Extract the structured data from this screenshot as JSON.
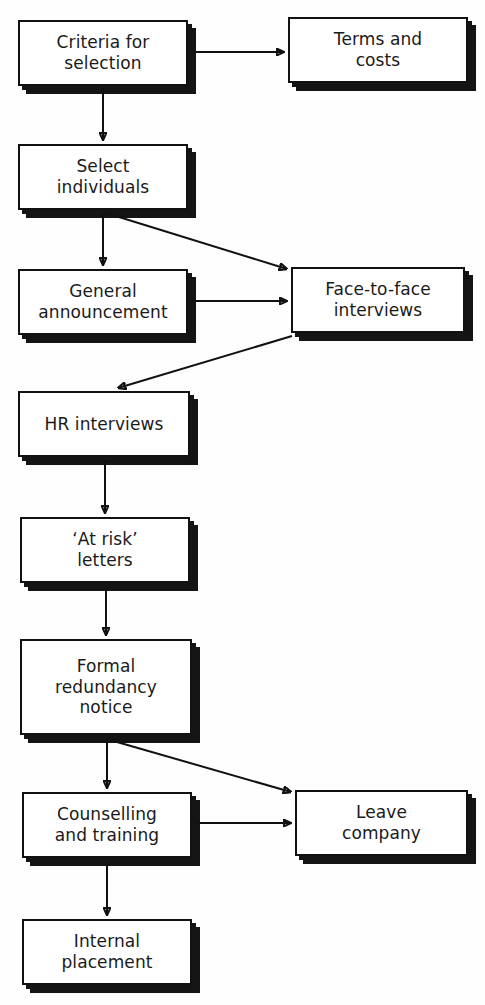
{
  "diagram": {
    "style": {
      "box_fill": "#ffffff",
      "box_border": "#111111",
      "shadow_color": "#141414",
      "arrow_color": "#111111",
      "page_background": "#fefefe"
    },
    "nodes": [
      {
        "id": "criteria-for-selection",
        "label": "Criteria for\nselection",
        "x": 18,
        "y": 20,
        "w": 170,
        "h": 66
      },
      {
        "id": "terms-and-costs",
        "label": "Terms and\ncosts",
        "x": 288,
        "y": 17,
        "w": 180,
        "h": 66
      },
      {
        "id": "select-individuals",
        "label": "Select\nindividuals",
        "x": 18,
        "y": 144,
        "w": 170,
        "h": 66
      },
      {
        "id": "general-announcement",
        "label": "General\nannouncement",
        "x": 18,
        "y": 269,
        "w": 170,
        "h": 66
      },
      {
        "id": "face-to-face-interviews",
        "label": "Face-to-face\ninterviews",
        "x": 291,
        "y": 267,
        "w": 174,
        "h": 66
      },
      {
        "id": "hr-interviews",
        "label": "HR interviews",
        "x": 18,
        "y": 391,
        "w": 172,
        "h": 66
      },
      {
        "id": "at-risk-letters",
        "label": "‘At risk’\nletters",
        "x": 20,
        "y": 517,
        "w": 170,
        "h": 66
      },
      {
        "id": "formal-redundancy-notice",
        "label": "Formal\nredundancy\nnotice",
        "x": 20,
        "y": 639,
        "w": 172,
        "h": 96
      },
      {
        "id": "counselling-and-training",
        "label": "Counselling\nand training",
        "x": 22,
        "y": 792,
        "w": 170,
        "h": 66
      },
      {
        "id": "leave-company",
        "label": "Leave\ncompany",
        "x": 295,
        "y": 790,
        "w": 173,
        "h": 66
      },
      {
        "id": "internal-placement",
        "label": "Internal\nplacement",
        "x": 22,
        "y": 919,
        "w": 170,
        "h": 66
      }
    ],
    "edges": [
      {
        "id": "criteria-to-terms",
        "from": "criteria-for-selection",
        "to": "terms-and-costs",
        "kind": "horizontal",
        "x1": 190,
        "y1": 52,
        "x2": 284,
        "y2": 52
      },
      {
        "id": "criteria-to-select",
        "from": "criteria-for-selection",
        "to": "select-individuals",
        "kind": "vertical",
        "x1": 103,
        "y1": 88,
        "x2": 103,
        "y2": 140
      },
      {
        "id": "select-to-general",
        "from": "select-individuals",
        "to": "general-announcement",
        "kind": "vertical",
        "x1": 103,
        "y1": 212,
        "x2": 103,
        "y2": 265
      },
      {
        "id": "select-to-face-to-face",
        "from": "select-individuals",
        "to": "face-to-face-interviews",
        "kind": "diagonal",
        "x1": 106,
        "y1": 213,
        "x2": 287,
        "y2": 269
      },
      {
        "id": "general-to-face-to-face",
        "from": "general-announcement",
        "to": "face-to-face-interviews",
        "kind": "horizontal",
        "x1": 192,
        "y1": 301,
        "x2": 287,
        "y2": 301
      },
      {
        "id": "face-to-face-to-hr",
        "from": "face-to-face-interviews",
        "to": "hr-interviews",
        "kind": "diagonal",
        "x1": 292,
        "y1": 336,
        "x2": 118,
        "y2": 388
      },
      {
        "id": "hr-to-at-risk",
        "from": "hr-interviews",
        "to": "at-risk-letters",
        "kind": "vertical",
        "x1": 105,
        "y1": 460,
        "x2": 105,
        "y2": 513
      },
      {
        "id": "at-risk-to-formal",
        "from": "at-risk-letters",
        "to": "formal-redundancy-notice",
        "kind": "vertical",
        "x1": 106,
        "y1": 586,
        "x2": 106,
        "y2": 635
      },
      {
        "id": "formal-to-counselling",
        "from": "formal-redundancy-notice",
        "to": "counselling-and-training",
        "kind": "vertical",
        "x1": 107,
        "y1": 738,
        "x2": 107,
        "y2": 788
      },
      {
        "id": "formal-to-leave-company",
        "from": "formal-redundancy-notice",
        "to": "leave-company",
        "kind": "diagonal",
        "x1": 110,
        "y1": 740,
        "x2": 291,
        "y2": 792
      },
      {
        "id": "counselling-to-leave-company",
        "from": "counselling-and-training",
        "to": "leave-company",
        "kind": "horizontal",
        "x1": 196,
        "y1": 823,
        "x2": 291,
        "y2": 823
      },
      {
        "id": "counselling-to-internal",
        "from": "counselling-and-training",
        "to": "internal-placement",
        "kind": "vertical",
        "x1": 107,
        "y1": 861,
        "x2": 107,
        "y2": 915
      }
    ]
  }
}
